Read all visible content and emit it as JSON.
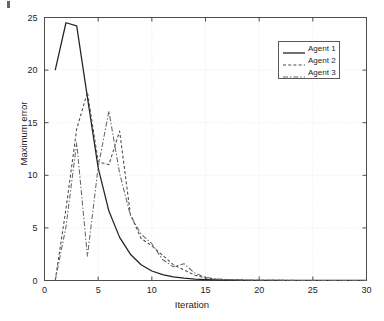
{
  "figure": {
    "background_color": "#ffffff",
    "axis_color": "#4d4d4d",
    "grid_color": "#e3e3e3",
    "text_color": "#1d1d1d"
  },
  "chart_data": {
    "type": "line",
    "title": "",
    "xlabel": "Iteration",
    "ylabel": "Maximum error",
    "xlim": [
      0,
      30
    ],
    "ylim": [
      0,
      25
    ],
    "xticks": [
      0,
      5,
      10,
      15,
      20,
      25,
      30
    ],
    "yticks": [
      0,
      5,
      10,
      15,
      20,
      25
    ],
    "xtick_labels": [
      "0",
      "5",
      "10",
      "15",
      "20",
      "25",
      "30"
    ],
    "ytick_labels": [
      "0",
      "5",
      "10",
      "15",
      "20",
      "25"
    ],
    "grid": true,
    "legend_position": "upper right",
    "legend_entries": [
      "Agent 1",
      "Agent 2",
      "Agent 3"
    ],
    "series": [
      {
        "name": "Agent 1",
        "style": "solid",
        "color": "#222222",
        "x": [
          1,
          2,
          3,
          4,
          5,
          6,
          7,
          8,
          9,
          10,
          11,
          12,
          13,
          14,
          15,
          16,
          17,
          18,
          19,
          20,
          21,
          22,
          23,
          24,
          25,
          26,
          27,
          28,
          29,
          30
        ],
        "y": [
          20.0,
          24.5,
          24.2,
          17.4,
          10.7,
          6.6,
          4.1,
          2.5,
          1.5,
          0.9,
          0.55,
          0.35,
          0.22,
          0.14,
          0.09,
          0.06,
          0.04,
          0.03,
          0.02,
          0.015,
          0.01,
          0.008,
          0.006,
          0.005,
          0.004,
          0.003,
          0.002,
          0.002,
          0.001,
          0.001
        ]
      },
      {
        "name": "Agent 2",
        "style": "dashed",
        "color": "#4a4a4a",
        "x": [
          1,
          2,
          3,
          4,
          5,
          6,
          7,
          8,
          9,
          10,
          11,
          12,
          13,
          14,
          15,
          16,
          17,
          18,
          19,
          20,
          21,
          22,
          23,
          24,
          25,
          26,
          27,
          28,
          29,
          30
        ],
        "y": [
          0.0,
          6.8,
          14.4,
          17.9,
          11.3,
          11.0,
          14.2,
          6.3,
          4.0,
          3.3,
          2.4,
          1.5,
          1.0,
          0.5,
          0.25,
          0.12,
          0.08,
          0.05,
          0.03,
          0.02,
          0.015,
          0.01,
          0.008,
          0.006,
          0.005,
          0.004,
          0.003,
          0.002,
          0.002,
          0.001
        ]
      },
      {
        "name": "Agent 3",
        "style": "dashdot",
        "color": "#666666",
        "x": [
          1,
          2,
          3,
          4,
          5,
          6,
          7,
          8,
          9,
          10,
          11,
          12,
          13,
          14,
          15,
          16,
          17,
          18,
          19,
          20,
          21,
          22,
          23,
          24,
          25,
          26,
          27,
          28,
          29,
          30
        ],
        "y": [
          0.0,
          5.1,
          13.1,
          2.3,
          10.8,
          16.1,
          10.2,
          6.2,
          4.4,
          3.5,
          2.0,
          1.3,
          1.6,
          0.7,
          0.3,
          0.15,
          0.09,
          0.06,
          0.04,
          0.03,
          0.02,
          0.015,
          0.01,
          0.008,
          0.006,
          0.005,
          0.004,
          0.003,
          0.002,
          0.002
        ]
      }
    ]
  },
  "legend": {
    "items": [
      {
        "label": "Agent 1",
        "style": "solid"
      },
      {
        "label": "Agent 2",
        "style": "dashed"
      },
      {
        "label": "Agent 3",
        "style": "dashdot"
      }
    ]
  }
}
